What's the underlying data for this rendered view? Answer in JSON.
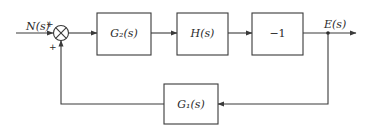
{
  "diagram": {
    "type": "block-diagram",
    "input": {
      "label": "N(s)",
      "sign": "+"
    },
    "summing_junction": {
      "inputs": [
        "N(s)",
        "feedback from G1(s)"
      ],
      "signs": [
        "+",
        "+"
      ]
    },
    "blocks": [
      {
        "id": "G2",
        "label": "G₂(s)",
        "path": "forward"
      },
      {
        "id": "H",
        "label": "H(s)",
        "path": "forward"
      },
      {
        "id": "neg1",
        "label": "−1",
        "path": "forward"
      },
      {
        "id": "G1",
        "label": "G₁(s)",
        "path": "feedback"
      }
    ],
    "output": {
      "label": "E(s)"
    },
    "signs": {
      "top": "+",
      "bottom": "+"
    },
    "connections": [
      "N(s) → Σ (+)",
      "Σ → G2(s)",
      "G2(s) → H(s)",
      "H(s) → −1",
      "−1 → E(s)",
      "E(s) → G1(s)",
      "G1(s) → Σ (+)"
    ],
    "colors": {
      "line": "#3a3a3a",
      "text": "#2a2a2a",
      "background": "#ffffff"
    }
  }
}
